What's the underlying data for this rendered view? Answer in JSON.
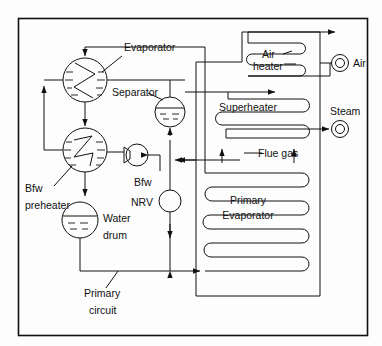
{
  "figure": {
    "type": "process-flow-diagram",
    "background_color": "#fdfdfd",
    "line_color": "#111111",
    "frame": {
      "x": 18,
      "y": 18,
      "width": 350,
      "height": 318
    }
  },
  "labels": {
    "evaporator": "Evaporator",
    "separator": "Separator",
    "bfw_preheater_line1": "Bfw",
    "bfw_preheater_line2": "preheater",
    "bfw": "Bfw",
    "nrv": "NRV",
    "water_drum_line1": "Water",
    "water_drum_line2": "drum",
    "primary_circuit_line1": "Primary",
    "primary_circuit_line2": "circuit",
    "air_heater_line1": "Air",
    "air_heater_line2": "heater",
    "superheater": "Superheater",
    "flue_gas": "Flue gas",
    "primary_evaporator_line1": "Primary",
    "primary_evaporator_line2": "Evaporator",
    "air": "Air",
    "steam": "Steam"
  },
  "equipment": [
    {
      "name": "evaporator",
      "symbol": "circle-zigzag-heat-exchanger",
      "cx": 85,
      "cy": 80,
      "r": 22
    },
    {
      "name": "separator",
      "symbol": "circle-liquid-level",
      "cx": 170,
      "cy": 112,
      "r": 15
    },
    {
      "name": "bfw-preheater",
      "symbol": "circle-zigzag-heat-exchanger",
      "cx": 85,
      "cy": 150,
      "r": 22
    },
    {
      "name": "circulation-pump",
      "symbol": "centrifugal-pump",
      "cx": 137,
      "cy": 155,
      "r": 11
    },
    {
      "name": "water-drum",
      "symbol": "circle-liquid-level",
      "cx": 80,
      "cy": 220,
      "r": 18
    },
    {
      "name": "nrv-valve",
      "symbol": "circle-valve",
      "cx": 170,
      "cy": 201,
      "r": 11
    },
    {
      "name": "air-outlet",
      "symbol": "concentric-circle-nozzle",
      "cx": 340,
      "cy": 63,
      "r": 9
    },
    {
      "name": "steam-outlet",
      "symbol": "concentric-circle-nozzle",
      "cx": 340,
      "cy": 129,
      "r": 9
    }
  ],
  "coils": [
    {
      "name": "air-heater-coil",
      "passes": 3
    },
    {
      "name": "superheater-coil",
      "passes": 3
    },
    {
      "name": "primary-evaporator-coil",
      "passes": 5
    }
  ],
  "flow_arrows": [
    {
      "name": "flue-gas-left",
      "direction": "up"
    },
    {
      "name": "flue-gas-right",
      "direction": "up"
    }
  ]
}
